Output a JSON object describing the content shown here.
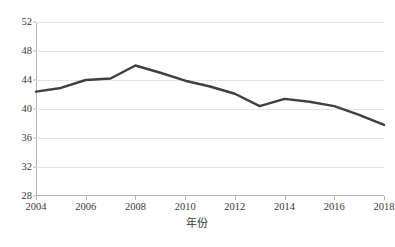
{
  "chart_data": {
    "type": "line",
    "title": "",
    "subtitle": "",
    "xlabel": "年份",
    "ylabel": "",
    "x": [
      2004,
      2005,
      2006,
      2007,
      2008,
      2009,
      2010,
      2011,
      2012,
      2013,
      2014,
      2015,
      2016,
      2017,
      2018
    ],
    "values": [
      42.4,
      42.9,
      44.0,
      44.2,
      46.0,
      45.0,
      43.9,
      43.1,
      42.1,
      40.4,
      41.4,
      41.0,
      40.4,
      39.2,
      37.8
    ],
    "series": [
      {
        "name": "",
        "values": [
          42.4,
          42.9,
          44.0,
          44.2,
          46.0,
          45.0,
          43.9,
          43.1,
          42.1,
          40.4,
          41.4,
          41.0,
          40.4,
          39.2,
          37.8
        ],
        "color": "#3f3f3f"
      }
    ],
    "xlim": [
      2004,
      2018
    ],
    "ylim": [
      28,
      52
    ],
    "y_ticks": [
      28,
      32,
      36,
      40,
      44,
      48,
      52
    ],
    "y_tick_labels": [
      "28",
      "32",
      "36",
      "40",
      "44",
      "48",
      "52"
    ],
    "x_ticks": [
      2004,
      2006,
      2008,
      2010,
      2012,
      2014,
      2016,
      2018
    ],
    "x_tick_labels": [
      "2004",
      "2006",
      "2008",
      "2010",
      "2012",
      "2014",
      "2016",
      "2018"
    ],
    "grid": "horizontal",
    "legend": "none",
    "annotations": []
  },
  "figure": {
    "caption": "",
    "background_color": "#ffffff",
    "line_color": "#3f3f3f",
    "gridline_color": "#e3e3e3",
    "axis_color": "#b6b6b6",
    "text_color": "#3a3a3a"
  }
}
